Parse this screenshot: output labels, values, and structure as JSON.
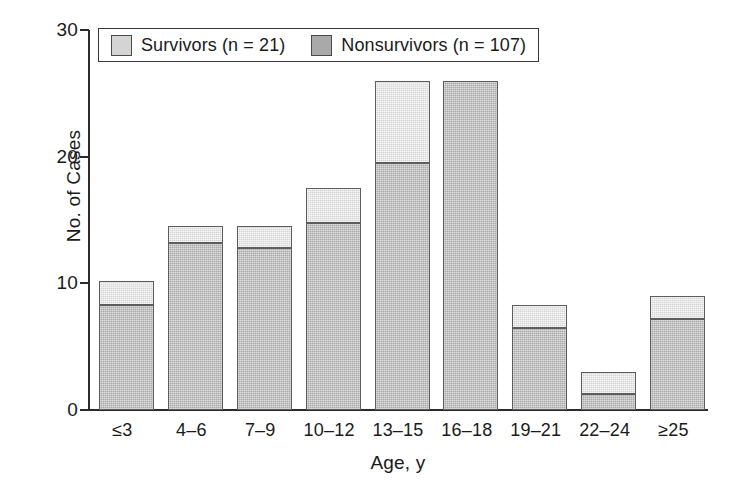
{
  "chart_data": {
    "type": "bar",
    "title": "",
    "subtitle": "",
    "xlabel": "Age, y",
    "ylabel": "No. of Cases",
    "categories": [
      "≤3",
      "4–6",
      "7–9",
      "10–12",
      "13–15",
      "16–18",
      "19–21",
      "22–24",
      "≥25"
    ],
    "stacked": true,
    "series": [
      {
        "name": "Nonsurvivors (n = 107)",
        "values": [
          8.3,
          13.2,
          12.8,
          14.8,
          19.5,
          26,
          6.5,
          1.3,
          7.2
        ],
        "color": "#a9a9a9"
      },
      {
        "name": "Survivors (n = 21)",
        "values": [
          1.9,
          1.3,
          1.7,
          2.7,
          6.5,
          0,
          1.8,
          1.7,
          1.8
        ],
        "color": "#d4d4d4"
      }
    ],
    "totals": [
      10.2,
      14.5,
      14.5,
      17.5,
      26,
      26,
      8.3,
      3.0,
      9.0
    ],
    "ylim": [
      0,
      30
    ],
    "yticks": [
      0,
      10,
      20,
      30
    ],
    "ytick_labels": [
      "0",
      "10",
      "20",
      "30"
    ],
    "grid": false,
    "legend_position": "top-left-inside"
  },
  "axes": {
    "y_title": "No. of Cases",
    "x_title": "Age, y",
    "y_ticks": [
      {
        "value": 30,
        "label": "30"
      },
      {
        "value": 20,
        "label": "20"
      },
      {
        "value": 10,
        "label": "10"
      },
      {
        "value": 0,
        "label": "0"
      }
    ],
    "x_ticks": [
      {
        "label": "≤3"
      },
      {
        "label": "4–6"
      },
      {
        "label": "7–9"
      },
      {
        "label": "10–12"
      },
      {
        "label": "13–15"
      },
      {
        "label": "16–18"
      },
      {
        "label": "19–21"
      },
      {
        "label": "22–24"
      },
      {
        "label": "≥25"
      }
    ]
  },
  "legend": {
    "items": [
      {
        "label": "Survivors (n = 21)",
        "color": "#d4d4d4",
        "key": "survivors"
      },
      {
        "label": "Nonsurvivors (n = 107)",
        "color": "#a9a9a9",
        "key": "nonsurvivors"
      }
    ]
  },
  "colors": {
    "survivors": "#d4d4d4",
    "nonsurvivors": "#a9a9a9",
    "axis": "#2b2b2b",
    "bar_border": "#5d5d5d",
    "background": "#ffffff"
  }
}
